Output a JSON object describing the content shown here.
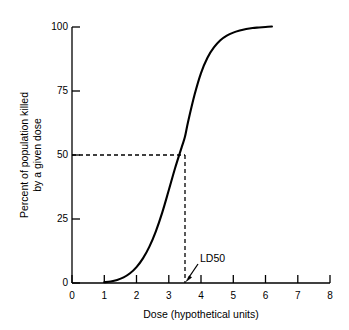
{
  "chart_data": {
    "type": "line",
    "title": "",
    "subtitle": "",
    "xlabel": "Dose (hypothetical units)",
    "ylabel_line1": "Percent of population killed",
    "ylabel_line2": "by a given dose",
    "xlim": [
      0,
      8
    ],
    "ylim": [
      0,
      100
    ],
    "grid": false,
    "legend": "none",
    "xticks": [
      "0",
      "1",
      "2",
      "3",
      "4",
      "5",
      "6",
      "7",
      "8"
    ],
    "xtick_values": [
      0,
      1,
      2,
      3,
      4,
      5,
      6,
      7,
      8
    ],
    "yticks": [
      "0",
      "25",
      "50",
      "75",
      "100"
    ],
    "ytick_values": [
      0,
      25,
      50,
      75,
      100
    ],
    "series": [
      {
        "name": "Dose-response curve",
        "x": [
          1.0,
          1.2,
          1.4,
          1.6,
          1.8,
          2.0,
          2.2,
          2.4,
          2.6,
          2.8,
          3.0,
          3.2,
          3.4,
          3.5,
          3.6,
          3.8,
          4.0,
          4.2,
          4.4,
          4.6,
          4.8,
          5.0,
          5.2,
          5.4,
          5.6,
          5.8,
          6.0,
          6.2
        ],
        "y": [
          0.3,
          0.6,
          1.2,
          2.2,
          3.8,
          6.2,
          9.6,
          14.2,
          20.2,
          27.6,
          36.2,
          45.0,
          53.0,
          57.0,
          63.0,
          73.5,
          82.0,
          88.0,
          92.0,
          94.8,
          96.6,
          97.8,
          98.6,
          99.2,
          99.6,
          99.8,
          100.0,
          100.2
        ]
      }
    ],
    "annotations": [
      {
        "id": "ld50",
        "label": "LD50",
        "x": 3.5,
        "y": 0,
        "note": "Arrow points to dose 3.5 at baseline; dashed guides mark 50% kill at dose 3.5"
      }
    ],
    "reference_lines": [
      {
        "id": "ld50-horizontal",
        "orientation": "horizontal",
        "value": 50,
        "from_x": 0,
        "to_x": 3.5,
        "style": "dashed"
      },
      {
        "id": "ld50-vertical",
        "orientation": "vertical",
        "value": 3.5,
        "from_y": 0,
        "to_y": 50,
        "style": "dashed"
      }
    ],
    "colors": {
      "background": "#ffffff",
      "curve": "#000000",
      "axis": "#000000",
      "dashed": "#000000",
      "text": "#000000"
    }
  }
}
